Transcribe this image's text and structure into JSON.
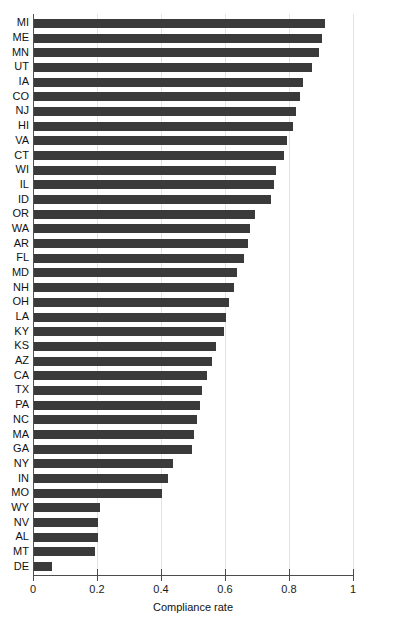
{
  "chart_data": {
    "type": "bar",
    "orientation": "horizontal",
    "title": "",
    "xlabel": "Compliance rate",
    "ylabel": "",
    "xlim": [
      0,
      1.05
    ],
    "xticks": [
      "0",
      "0.2",
      "0.4",
      "0.6",
      "0.8",
      "1"
    ],
    "xtick_values": [
      0,
      0.2,
      0.4,
      0.6,
      0.8,
      1
    ],
    "grid": "vertical",
    "legend": "none",
    "bar_color": "#3a3a3a",
    "categories": [
      "MI",
      "ME",
      "MN",
      "UT",
      "IA",
      "CO",
      "NJ",
      "HI",
      "VA",
      "CT",
      "WI",
      "IL",
      "ID",
      "OR",
      "WA",
      "AR",
      "FL",
      "MD",
      "NH",
      "OH",
      "LA",
      "KY",
      "KS",
      "AZ",
      "CA",
      "TX",
      "PA",
      "NC",
      "MA",
      "GA",
      "NY",
      "IN",
      "MO",
      "WY",
      "NV",
      "AL",
      "MT",
      "DE"
    ],
    "values": [
      0.91,
      0.9,
      0.89,
      0.87,
      0.84,
      0.83,
      0.82,
      0.81,
      0.79,
      0.78,
      0.755,
      0.75,
      0.74,
      0.69,
      0.675,
      0.67,
      0.655,
      0.635,
      0.625,
      0.61,
      0.6,
      0.595,
      0.57,
      0.555,
      0.54,
      0.525,
      0.52,
      0.51,
      0.5,
      0.495,
      0.435,
      0.42,
      0.4,
      0.205,
      0.2,
      0.2,
      0.19,
      0.055
    ]
  },
  "axis": {
    "x_title": "Compliance rate"
  }
}
